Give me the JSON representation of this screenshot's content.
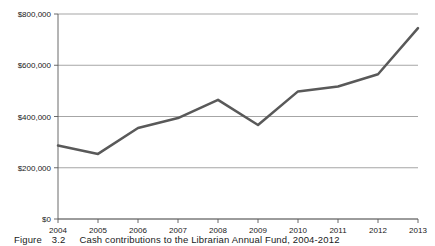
{
  "figure": {
    "caption_label": "Figure",
    "caption_number": "3.2",
    "caption_text": "Cash contributions to the Librarian Annual Fund, 2004-2012"
  },
  "chart_data": {
    "type": "line",
    "title": "",
    "subtitle": "",
    "xlabel": "",
    "ylabel": "",
    "categories": [
      "2004",
      "2005",
      "2006",
      "2007",
      "2008",
      "2009",
      "2010",
      "2011",
      "2012",
      "2013"
    ],
    "values": [
      287000,
      254000,
      355000,
      394000,
      465000,
      367000,
      498000,
      517000,
      565000,
      745000
    ],
    "series": [
      {
        "name": "Cash contributions",
        "values": [
          287000,
          254000,
          355000,
          394000,
          465000,
          367000,
          498000,
          517000,
          565000,
          745000
        ],
        "color": "#595959"
      }
    ],
    "ylim": [
      0,
      800000
    ],
    "y_ticks": [
      0,
      200000,
      400000,
      600000,
      800000
    ],
    "y_tick_labels": [
      "$0",
      "$200,000",
      "$400,000",
      "$600,000",
      "$800,000"
    ],
    "x_tick_labels": [
      "2004",
      "2005",
      "2006",
      "2007",
      "2008",
      "2009",
      "2010",
      "2011",
      "2012",
      "2013"
    ],
    "grid": true,
    "grid_axis": "y",
    "grid_color": "#808080",
    "axis_color": "#595959",
    "legend": false,
    "legend_position": "none",
    "markers": false,
    "line_width": 2.5,
    "plot_area": {
      "left": 58,
      "right": 418,
      "top": 14,
      "bottom": 219
    }
  }
}
